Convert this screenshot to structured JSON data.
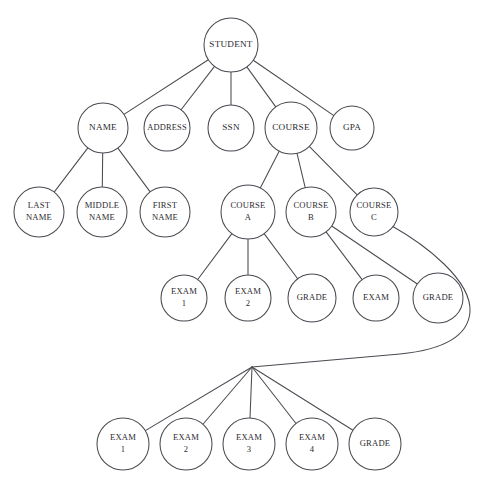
{
  "diagram": {
    "type": "tree",
    "background_color": "#ffffff",
    "line_color": "#4a4a52",
    "text_color": "#2b2b30",
    "width": 486,
    "height": 484,
    "nodes": [
      {
        "id": "student",
        "label": "STUDENT",
        "lines": [
          "STUDENT"
        ],
        "cx": 231,
        "cy": 45,
        "r": 27,
        "font_size": 9.2,
        "level": 0
      },
      {
        "id": "name",
        "label": "NAME",
        "lines": [
          "NAME"
        ],
        "cx": 103,
        "cy": 128,
        "r": 25,
        "font_size": 9.2,
        "level": 1
      },
      {
        "id": "address",
        "label": "ADDRESS",
        "lines": [
          "ADDRESS"
        ],
        "cx": 167,
        "cy": 128,
        "r": 23,
        "font_size": 8.4,
        "level": 1
      },
      {
        "id": "ssn",
        "label": "SSN",
        "lines": [
          "SSN"
        ],
        "cx": 231,
        "cy": 128,
        "r": 23,
        "font_size": 9.2,
        "level": 1
      },
      {
        "id": "course",
        "label": "COURSE",
        "lines": [
          "COURSE"
        ],
        "cx": 291,
        "cy": 128,
        "r": 26,
        "font_size": 9.2,
        "level": 1
      },
      {
        "id": "gpa",
        "label": "GPA",
        "lines": [
          "GPA"
        ],
        "cx": 352,
        "cy": 128,
        "r": 22,
        "font_size": 9.2,
        "level": 1
      },
      {
        "id": "last-name",
        "label": "LAST NAME",
        "lines": [
          "LAST",
          "NAME"
        ],
        "cx": 39,
        "cy": 212,
        "r": 25,
        "font_size": 8.6,
        "level": 2
      },
      {
        "id": "middle-name",
        "label": "MIDDLE NAME",
        "lines": [
          "MIDDLE",
          "NAME"
        ],
        "cx": 102,
        "cy": 212,
        "r": 25,
        "font_size": 8.6,
        "level": 2
      },
      {
        "id": "first-name",
        "label": "FIRST NAME",
        "lines": [
          "FIRST",
          "NAME"
        ],
        "cx": 165,
        "cy": 212,
        "r": 25,
        "font_size": 8.6,
        "level": 2
      },
      {
        "id": "course-a",
        "label": "COURSE A",
        "lines": [
          "COURSE",
          "A"
        ],
        "cx": 248,
        "cy": 212,
        "r": 27,
        "font_size": 8.6,
        "level": 2
      },
      {
        "id": "course-b",
        "label": "COURSE B",
        "lines": [
          "COURSE",
          "B"
        ],
        "cx": 311,
        "cy": 212,
        "r": 25,
        "font_size": 8.6,
        "level": 2
      },
      {
        "id": "course-c",
        "label": "COURSE C",
        "lines": [
          "COURSE",
          "C"
        ],
        "cx": 374,
        "cy": 212,
        "r": 24,
        "font_size": 8.6,
        "level": 2
      },
      {
        "id": "a-exam-1",
        "label": "EXAM 1",
        "lines": [
          "EXAM",
          "1"
        ],
        "cx": 184,
        "cy": 298,
        "r": 23,
        "font_size": 8.6,
        "level": 3
      },
      {
        "id": "a-exam-2",
        "label": "EXAM 2",
        "lines": [
          "EXAM",
          "2"
        ],
        "cx": 248,
        "cy": 298,
        "r": 23,
        "font_size": 8.6,
        "level": 3
      },
      {
        "id": "a-grade",
        "label": "GRADE",
        "lines": [
          "GRADE"
        ],
        "cx": 312,
        "cy": 298,
        "r": 24,
        "font_size": 8.6,
        "level": 3
      },
      {
        "id": "b-exam",
        "label": "EXAM",
        "lines": [
          "EXAM"
        ],
        "cx": 376,
        "cy": 298,
        "r": 23,
        "font_size": 8.6,
        "level": 3
      },
      {
        "id": "b-grade",
        "label": "GRADE",
        "lines": [
          "GRADE"
        ],
        "cx": 438,
        "cy": 298,
        "r": 25,
        "font_size": 8.6,
        "level": 3
      },
      {
        "id": "c-exam-1",
        "label": "EXAM 1",
        "lines": [
          "EXAM",
          "1"
        ],
        "cx": 123,
        "cy": 444,
        "r": 26,
        "font_size": 8.6,
        "level": 4
      },
      {
        "id": "c-exam-2",
        "label": "EXAM 2",
        "lines": [
          "EXAM",
          "2"
        ],
        "cx": 186,
        "cy": 444,
        "r": 26,
        "font_size": 8.6,
        "level": 4
      },
      {
        "id": "c-exam-3",
        "label": "EXAM 3",
        "lines": [
          "EXAM",
          "3"
        ],
        "cx": 249,
        "cy": 444,
        "r": 26,
        "font_size": 8.6,
        "level": 4
      },
      {
        "id": "c-exam-4",
        "label": "EXAM 4",
        "lines": [
          "EXAM",
          "4"
        ],
        "cx": 312,
        "cy": 444,
        "r": 26,
        "font_size": 8.6,
        "level": 4
      },
      {
        "id": "c-grade",
        "label": "GRADE",
        "lines": [
          "GRADE"
        ],
        "cx": 375,
        "cy": 444,
        "r": 26,
        "font_size": 8.6,
        "level": 4
      }
    ],
    "edges": [
      {
        "id": "student-name",
        "from": "student",
        "to": "name"
      },
      {
        "id": "student-address",
        "from": "student",
        "to": "address"
      },
      {
        "id": "student-ssn",
        "from": "student",
        "to": "ssn"
      },
      {
        "id": "student-course",
        "from": "student",
        "to": "course"
      },
      {
        "id": "student-gpa",
        "from": "student",
        "to": "gpa"
      },
      {
        "id": "name-last-name",
        "from": "name",
        "to": "last-name"
      },
      {
        "id": "name-middle-name",
        "from": "name",
        "to": "middle-name"
      },
      {
        "id": "name-first-name",
        "from": "name",
        "to": "first-name"
      },
      {
        "id": "course-course-a",
        "from": "course",
        "to": "course-a"
      },
      {
        "id": "course-course-b",
        "from": "course",
        "to": "course-b"
      },
      {
        "id": "course-course-c",
        "from": "course",
        "to": "course-c"
      },
      {
        "id": "course-a-exam-1",
        "from": "course-a",
        "to": "a-exam-1"
      },
      {
        "id": "course-a-exam-2",
        "from": "course-a",
        "to": "a-exam-2"
      },
      {
        "id": "course-a-grade",
        "from": "course-a",
        "to": "a-grade"
      },
      {
        "id": "course-b-exam",
        "from": "course-b",
        "to": "b-exam"
      },
      {
        "id": "course-b-grade",
        "from": "course-b",
        "to": "b-grade"
      },
      {
        "id": "fan-c-exam-1",
        "from": "fan",
        "to": "c-exam-1"
      },
      {
        "id": "fan-c-exam-2",
        "from": "fan",
        "to": "c-exam-2"
      },
      {
        "id": "fan-c-exam-3",
        "from": "fan",
        "to": "c-exam-3"
      },
      {
        "id": "fan-c-exam-4",
        "from": "fan",
        "to": "c-exam-4"
      },
      {
        "id": "fan-c-grade",
        "from": "fan",
        "to": "c-grade"
      }
    ],
    "fan_point": {
      "id": "fan",
      "x": 252,
      "y": 367
    },
    "curved_edge": {
      "id": "course-c-to-fan",
      "from": "course-c",
      "to": "fan",
      "path": "M 392 226 C 424 244 472 280 470 312 C 468 338 440 350 400 354 L 252 367"
    }
  }
}
